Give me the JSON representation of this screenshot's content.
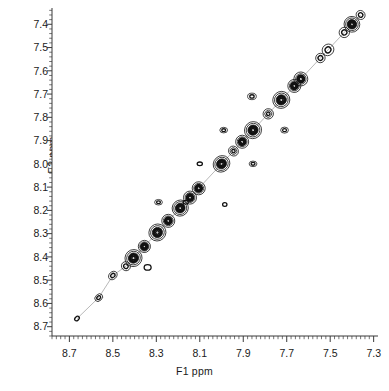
{
  "chart_data": {
    "type": "scatter",
    "plot_kind": "2d-nmr-contour",
    "title": "",
    "xlabel": "F1 ppm",
    "ylabel": "F2 ppm",
    "xlim": [
      8.78,
      7.28
    ],
    "ylim": [
      7.33,
      8.74
    ],
    "x_reversed": true,
    "y_reversed": true,
    "grid": false,
    "legend": "none",
    "background_color": "#ffffff",
    "contour_color": "#111111",
    "axis_color": "#3a3a3a",
    "xticks": [
      8.7,
      8.5,
      8.3,
      8.1,
      7.9,
      7.7,
      7.5,
      7.3
    ],
    "xtick_labels": [
      "8.7",
      "8.5",
      "8.3",
      "8.1",
      "7.9",
      "7.7",
      "7.5",
      "7.3"
    ],
    "x_minor_tick_step": 0.02,
    "yticks": [
      7.4,
      7.5,
      7.6,
      7.7,
      7.8,
      7.9,
      8.0,
      8.1,
      8.2,
      8.3,
      8.4,
      8.5,
      8.6,
      8.7
    ],
    "ytick_labels": [
      "7.4",
      "7.5",
      "7.6",
      "7.7",
      "7.8",
      "7.9",
      "8.0",
      "8.1",
      "8.2",
      "8.3",
      "8.4",
      "8.5",
      "8.6",
      "8.7"
    ],
    "y_minor_tick_step": 0.02,
    "diagonal_peaks": [
      {
        "f1": 7.36,
        "f2": 7.36,
        "rx": 0.02,
        "ry": 0.02,
        "levels": 2,
        "intensity": "weak"
      },
      {
        "f1": 7.4,
        "f2": 7.4,
        "rx": 0.036,
        "ry": 0.034,
        "levels": 5,
        "intensity": "strong"
      },
      {
        "f1": 7.435,
        "f2": 7.435,
        "rx": 0.024,
        "ry": 0.022,
        "levels": 2,
        "intensity": "weak"
      },
      {
        "f1": 7.51,
        "f2": 7.51,
        "rx": 0.028,
        "ry": 0.024,
        "levels": 2,
        "intensity": "weak"
      },
      {
        "f1": 7.545,
        "f2": 7.545,
        "rx": 0.022,
        "ry": 0.02,
        "levels": 2,
        "intensity": "weak"
      },
      {
        "f1": 7.635,
        "f2": 7.635,
        "rx": 0.032,
        "ry": 0.03,
        "levels": 4,
        "intensity": "strong"
      },
      {
        "f1": 7.665,
        "f2": 7.665,
        "rx": 0.03,
        "ry": 0.028,
        "levels": 4,
        "intensity": "strong"
      },
      {
        "f1": 7.725,
        "f2": 7.725,
        "rx": 0.04,
        "ry": 0.036,
        "levels": 5,
        "intensity": "strong"
      },
      {
        "f1": 7.785,
        "f2": 7.785,
        "rx": 0.024,
        "ry": 0.022,
        "levels": 3,
        "intensity": "medium"
      },
      {
        "f1": 7.855,
        "f2": 7.855,
        "rx": 0.04,
        "ry": 0.036,
        "levels": 5,
        "intensity": "strong"
      },
      {
        "f1": 7.905,
        "f2": 7.905,
        "rx": 0.03,
        "ry": 0.028,
        "levels": 4,
        "intensity": "strong"
      },
      {
        "f1": 7.945,
        "f2": 7.945,
        "rx": 0.022,
        "ry": 0.022,
        "levels": 3,
        "intensity": "medium"
      },
      {
        "f1": 8.0,
        "f2": 8.0,
        "rx": 0.04,
        "ry": 0.034,
        "levels": 5,
        "intensity": "strong"
      },
      {
        "f1": 8.105,
        "f2": 8.105,
        "rx": 0.03,
        "ry": 0.028,
        "levels": 4,
        "intensity": "strong"
      },
      {
        "f1": 8.145,
        "f2": 8.145,
        "rx": 0.03,
        "ry": 0.028,
        "levels": 4,
        "intensity": "strong"
      },
      {
        "f1": 8.19,
        "f2": 8.19,
        "rx": 0.038,
        "ry": 0.034,
        "levels": 5,
        "intensity": "strong"
      },
      {
        "f1": 8.245,
        "f2": 8.245,
        "rx": 0.03,
        "ry": 0.028,
        "levels": 4,
        "intensity": "strong"
      },
      {
        "f1": 8.295,
        "f2": 8.295,
        "rx": 0.04,
        "ry": 0.036,
        "levels": 5,
        "intensity": "strong"
      },
      {
        "f1": 8.355,
        "f2": 8.355,
        "rx": 0.028,
        "ry": 0.026,
        "levels": 4,
        "intensity": "strong"
      },
      {
        "f1": 8.405,
        "f2": 8.405,
        "rx": 0.04,
        "ry": 0.036,
        "levels": 5,
        "intensity": "strong"
      },
      {
        "f1": 8.44,
        "f2": 8.44,
        "rx": 0.02,
        "ry": 0.02,
        "levels": 2,
        "intensity": "weak"
      },
      {
        "f1": 8.5,
        "f2": 8.48,
        "rx": 0.022,
        "ry": 0.016,
        "levels": 2,
        "intensity": "weak"
      },
      {
        "f1": 8.565,
        "f2": 8.575,
        "rx": 0.02,
        "ry": 0.014,
        "levels": 2,
        "intensity": "weak"
      },
      {
        "f1": 8.665,
        "f2": 8.665,
        "rx": 0.012,
        "ry": 0.008,
        "levels": 1,
        "intensity": "trace"
      }
    ],
    "cross_peaks": [
      {
        "f1": 7.86,
        "f2": 7.71,
        "rx": 0.02,
        "ry": 0.014,
        "levels": 2,
        "intensity": "weak"
      },
      {
        "f1": 7.71,
        "f2": 7.855,
        "rx": 0.018,
        "ry": 0.013,
        "levels": 2,
        "intensity": "weak"
      },
      {
        "f1": 7.99,
        "f2": 7.855,
        "rx": 0.018,
        "ry": 0.012,
        "levels": 2,
        "intensity": "weak"
      },
      {
        "f1": 7.855,
        "f2": 8.0,
        "rx": 0.018,
        "ry": 0.012,
        "levels": 2,
        "intensity": "weak"
      },
      {
        "f1": 8.1,
        "f2": 8.0,
        "rx": 0.012,
        "ry": 0.008,
        "levels": 1,
        "intensity": "trace"
      },
      {
        "f1": 8.29,
        "f2": 8.165,
        "rx": 0.018,
        "ry": 0.012,
        "levels": 2,
        "intensity": "weak"
      },
      {
        "f1": 8.165,
        "f2": 8.165,
        "rx": 0.012,
        "ry": 0.008,
        "levels": 1,
        "intensity": "trace"
      },
      {
        "f1": 7.985,
        "f2": 8.175,
        "rx": 0.01,
        "ry": 0.008,
        "levels": 1,
        "intensity": "trace"
      },
      {
        "f1": 8.34,
        "f2": 8.445,
        "rx": 0.016,
        "ry": 0.012,
        "levels": 1,
        "intensity": "trace"
      }
    ]
  },
  "axis": {
    "xlabel": "F1 ppm",
    "ylabel": "F2 ppm"
  }
}
